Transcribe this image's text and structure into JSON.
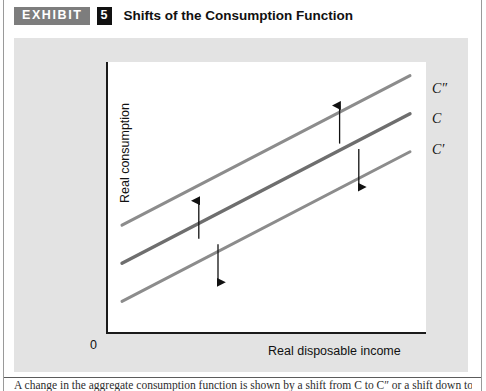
{
  "header": {
    "exhibit_label": "EXHIBIT",
    "exhibit_number": "5",
    "title": "Shifts of the Consumption Function",
    "badge_color": "#7d7d7d",
    "number_badge_color": "#111111"
  },
  "chart_data": {
    "type": "line",
    "title": "Shifts of the Consumption Function",
    "xlabel": "Real disposable income",
    "ylabel": "Real consumption",
    "origin_label": "0",
    "xlim": [
      0,
      100
    ],
    "ylim": [
      0,
      100
    ],
    "grid": false,
    "legend_position": "right-inline",
    "axis_ticks": false,
    "series": [
      {
        "name": "C″",
        "label": "C″",
        "color": "#8c8c8c",
        "description": "upward shifted consumption function",
        "x": [
          5,
          95
        ],
        "y": [
          40,
          95
        ]
      },
      {
        "name": "C",
        "label": "C",
        "color": "#6e6e6e",
        "description": "original consumption function",
        "x": [
          5,
          95
        ],
        "y": [
          26,
          81
        ]
      },
      {
        "name": "C′",
        "label": "C′",
        "color": "#8c8c8c",
        "description": "downward shifted consumption function",
        "x": [
          5,
          95
        ],
        "y": [
          12,
          67
        ]
      }
    ],
    "annotations": [
      {
        "name": "up-arrow-left",
        "type": "arrow",
        "direction": "up",
        "x": 29,
        "y_from": 35,
        "y_to": 49
      },
      {
        "name": "down-arrow-left",
        "type": "arrow",
        "direction": "down",
        "x": 35,
        "y_from": 33,
        "y_to": 19
      },
      {
        "name": "up-arrow-right",
        "type": "arrow",
        "direction": "up",
        "x": 73,
        "y_from": 70,
        "y_to": 84
      },
      {
        "name": "down-arrow-right",
        "type": "arrow",
        "direction": "down",
        "x": 79,
        "y_from": 68,
        "y_to": 54
      }
    ]
  },
  "caption": {
    "text": "A change in the aggregate consumption function is shown by a shift from C to C″ or a shift down to C′."
  }
}
